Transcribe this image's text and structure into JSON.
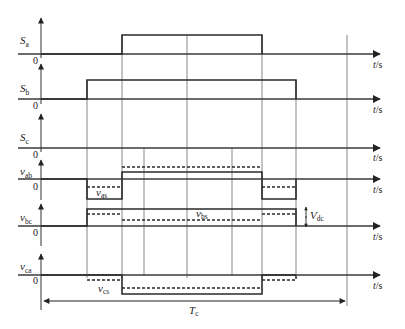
{
  "diagram": {
    "title": "",
    "time_axis_label": "t/s",
    "zero_label": "0",
    "period_label": {
      "main": "T",
      "sub": "c"
    },
    "dc_label": {
      "main": "V",
      "sub": "dc"
    },
    "channels": [
      {
        "id": "Sa",
        "label_main": "S",
        "label_sub": "a",
        "baseline_y": 54,
        "high_y": 35,
        "type": "pulse",
        "rise_x": 122,
        "fall_x": 262
      },
      {
        "id": "Sb",
        "label_main": "S",
        "label_sub": "b",
        "baseline_y": 99,
        "high_y": 80,
        "type": "pulse",
        "rise_x": 87,
        "fall_x": 296
      },
      {
        "id": "Sc",
        "label_main": "S",
        "label_sub": "c",
        "baseline_y": 148,
        "high_y": 148,
        "type": "zero"
      },
      {
        "id": "vab",
        "label_main": "v",
        "label_sub": "ab",
        "baseline_y": 179
      },
      {
        "id": "vbc",
        "label_main": "v",
        "label_sub": "bc",
        "baseline_y": 226
      },
      {
        "id": "vca",
        "label_main": "v",
        "label_sub": "ca",
        "baseline_y": 275
      }
    ],
    "annotations": [
      {
        "id": "vas",
        "main": "v",
        "sub": "as"
      },
      {
        "id": "vbs",
        "main": "v",
        "sub": "bs"
      },
      {
        "id": "vcs",
        "main": "v",
        "sub": "cs"
      }
    ],
    "switch_instants_x": [
      87,
      122,
      262,
      296
    ],
    "extra_grid_x": [
      144,
      187,
      232
    ],
    "period_start_x": 41,
    "period_end_x": 347
  }
}
